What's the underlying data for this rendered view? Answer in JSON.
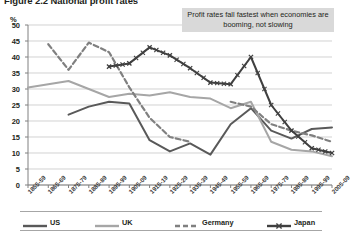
{
  "figure": {
    "title": "Figure 2.2 National profit rates",
    "y_axis_unit": "%",
    "annotation": "Profit rates fall fastest when economies are booming, not slowing"
  },
  "legend": {
    "position": "bottom",
    "items": [
      {
        "label": "US",
        "color": "#595959",
        "style": "solid"
      },
      {
        "label": "UK",
        "color": "#a6a6a6",
        "style": "solid"
      },
      {
        "label": "Germany",
        "color": "#808080",
        "style": "dashed"
      },
      {
        "label": "Japan",
        "color": "#404040",
        "style": "solid-x-markers"
      }
    ]
  },
  "chart_data": {
    "type": "line",
    "title": "Figure 2.2 National profit rates",
    "xlabel": "",
    "ylabel": "%",
    "ylim": [
      0,
      50
    ],
    "ytick_step": 5,
    "yticks": [
      0,
      5,
      10,
      15,
      20,
      25,
      30,
      35,
      40,
      45,
      50
    ],
    "grid": true,
    "categories": [
      "1855-59",
      "1865-69",
      "1875-79",
      "1885-89",
      "1895-99",
      "1905-09",
      "1915-19",
      "1925-29",
      "1935-39",
      "1945-49",
      "1955-59",
      "1965-69",
      "1975-79",
      "1985-89",
      "1995-99",
      "2005-09"
    ],
    "series": [
      {
        "name": "US",
        "color": "#595959",
        "style": "solid",
        "values": [
          null,
          null,
          22.0,
          24.5,
          26.0,
          25.5,
          14.0,
          10.5,
          13.0,
          9.5,
          19.0,
          24.0,
          17.0,
          14.5,
          17.5,
          18.0
        ]
      },
      {
        "name": "UK",
        "color": "#a6a6a6",
        "style": "solid",
        "values": [
          30.5,
          31.5,
          32.5,
          30.0,
          27.5,
          28.5,
          28.0,
          29.0,
          27.5,
          27.0,
          24.0,
          26.0,
          13.5,
          11.0,
          10.5,
          9.0
        ]
      },
      {
        "name": "Germany",
        "color": "#808080",
        "style": "dashed",
        "values": [
          null,
          44.0,
          36.0,
          44.5,
          41.5,
          30.5,
          21.0,
          15.0,
          13.5,
          null,
          26.0,
          24.5,
          19.0,
          17.0,
          15.5,
          13.5
        ]
      },
      {
        "name": "Japan",
        "color": "#404040",
        "style": "solid-x-markers",
        "values": [
          null,
          null,
          null,
          null,
          37.0,
          38.0,
          43.0,
          40.5,
          36.5,
          32.0,
          31.5,
          40.0,
          25.0,
          17.0,
          11.5,
          10.0
        ]
      }
    ]
  }
}
